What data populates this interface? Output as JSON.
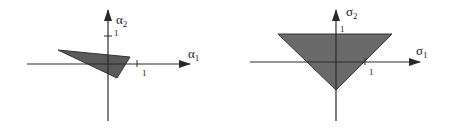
{
  "left_plot": {
    "x_axis_label": "α",
    "x_axis_sub": "1",
    "y_axis_label": "α",
    "y_axis_sub": "2",
    "x_tick_label": "1",
    "y_tick_label": "1",
    "region_fill": "#5a5a5a"
  },
  "right_plot": {
    "x_axis_label": "σ",
    "x_axis_sub": "1",
    "y_axis_label": "σ",
    "y_axis_sub": "2",
    "x_tick_label": "1",
    "y_tick_label": "1",
    "region_fill": "#6a6a6a"
  },
  "colors": {
    "axis": "#2a2a2a",
    "background": "#ffffff"
  }
}
